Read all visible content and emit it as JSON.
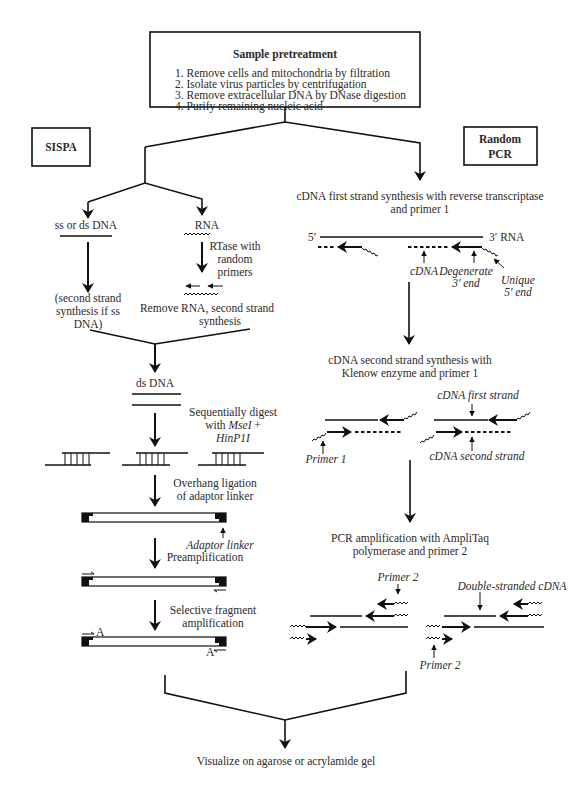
{
  "pretreatment": {
    "title": "Sample pretreatment",
    "steps": [
      "1.  Remove cells and mitochondria by filtration",
      "2.  Isolate virus particles by centrifugation",
      "3.  Remove extracellular DNA by DNase digestion",
      "4.  Purify remaining nucleic acid"
    ]
  },
  "sispa": {
    "label": "SISPA",
    "branch_dna": "ss or ds DNA",
    "branch_rna": "RNA",
    "rtase_label": [
      "RTase with",
      "random",
      "primers"
    ],
    "second_strand_note": [
      "(second strand",
      "synthesis if ss",
      "DNA)"
    ],
    "remove_rna": [
      "Remove RNA, second strand",
      "synthesis"
    ],
    "ds_dna": "ds DNA",
    "digest_label": [
      "Sequentially digest",
      "with ",
      "MseI",
      " +",
      "HinP1I"
    ],
    "ligation_label": [
      "Overhang ligation",
      "of adaptor linker"
    ],
    "adaptor_linker": "Adaptor linker",
    "preamplification": "Preamplification",
    "selective_label": [
      "Selective fragment",
      "amplification"
    ],
    "selective_base": "A"
  },
  "random_pcr": {
    "label": [
      "Random",
      "PCR"
    ],
    "first_strand": [
      "cDNA first strand synthesis with reverse transcriptase",
      "and primer 1"
    ],
    "five_prime": "5′",
    "three_prime_rna": "3′ RNA",
    "cdna": "cDNA",
    "degenerate": [
      "Degenerate",
      "3′ end"
    ],
    "unique": [
      "Unique",
      "5′ end"
    ],
    "second_strand": [
      "cDNA second strand synthesis with",
      "Klenow enzyme and primer 1"
    ],
    "cdna_first_strand": "cDNA first strand",
    "cdna_second_strand": "cDNA second strand",
    "primer1": "Primer 1",
    "pcr_amp": [
      "PCR amplification with AmpliTaq",
      "polymerase and primer 2"
    ],
    "primer2_top": "Primer 2",
    "primer2_bottom": "Primer 2",
    "double_stranded": "Double-stranded cDNA"
  },
  "final": {
    "label": "Visualize on agarose or acrylamide gel"
  }
}
